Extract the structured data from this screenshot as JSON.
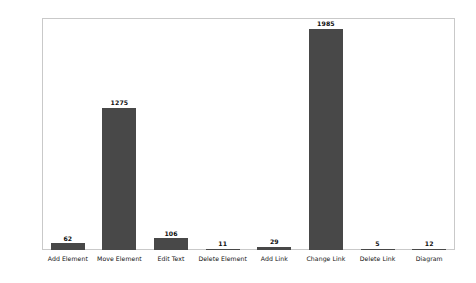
{
  "chart_data": {
    "type": "bar",
    "title": "",
    "xlabel": "",
    "ylabel": "",
    "categories": [
      "Add Element",
      "Move Element",
      "Edit Text",
      "Delete Element",
      "Add Link",
      "Change Link",
      "Delete Link",
      "Diagram"
    ],
    "values": [
      62,
      1275,
      106,
      11,
      29,
      1985,
      5,
      12
    ],
    "value_labels": [
      "62",
      "1275",
      "106",
      "11",
      "29",
      "1985",
      "5",
      "12"
    ],
    "ylim": [
      0,
      2080
    ],
    "yticks": [
      0,
      250,
      500,
      750,
      1000,
      1250,
      1500,
      1750,
      2000
    ],
    "ytick_labels": [
      "0",
      "250",
      "500",
      "750",
      "1000",
      "1250",
      "1500",
      "1750",
      "2000"
    ],
    "grid": false,
    "legend": null,
    "bar_color": "#484848",
    "frame_color": "#c9c9c9",
    "background_color": "#ffffff",
    "text_color": "#111111"
  }
}
